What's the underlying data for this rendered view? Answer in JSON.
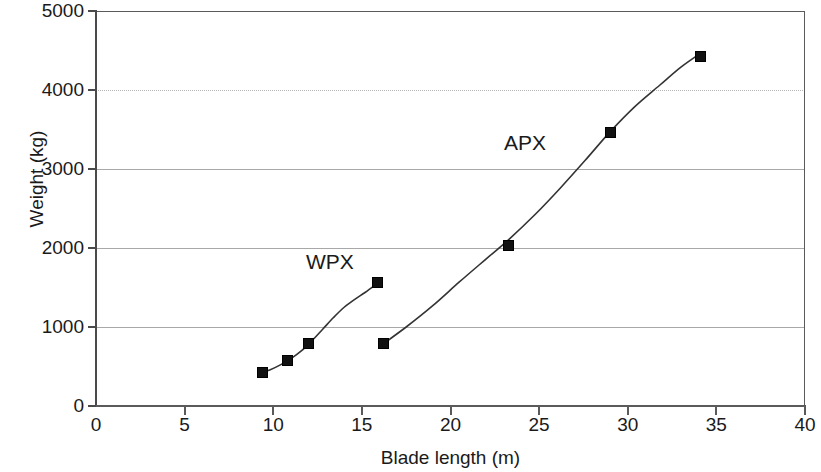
{
  "chart_data": {
    "type": "scatter",
    "title": "",
    "xlabel": "Blade length (m)",
    "ylabel": "Weight (kg)",
    "xlim": [
      0,
      40
    ],
    "ylim": [
      0,
      5000
    ],
    "xticks": [
      0,
      5,
      10,
      15,
      20,
      25,
      30,
      35,
      40
    ],
    "yticks": [
      0,
      1000,
      2000,
      3000,
      4000,
      5000
    ],
    "xtick_labels": [
      "0",
      "5",
      "10",
      "15",
      "20",
      "25",
      "30",
      "35",
      "40"
    ],
    "ytick_labels": [
      "0",
      "1000",
      "2000",
      "3000",
      "4000",
      "5000"
    ],
    "grid": "horizontal",
    "legend": "inline-annotations",
    "marker_color": "#111111",
    "line_color": "#333333",
    "gridline_color": "#a8a8a8",
    "axis_color": "#4a4a4a",
    "series": [
      {
        "name": "WPX",
        "label_x": 13.2,
        "label_y": 1820,
        "points": [
          {
            "x": 9.4,
            "y": 430
          },
          {
            "x": 10.8,
            "y": 580
          },
          {
            "x": 12.0,
            "y": 790
          },
          {
            "x": 15.9,
            "y": 1560
          }
        ],
        "fit_curve": [
          {
            "x": 9.2,
            "y": 410
          },
          {
            "x": 9.8,
            "y": 455
          },
          {
            "x": 10.4,
            "y": 520
          },
          {
            "x": 11.0,
            "y": 600
          },
          {
            "x": 11.6,
            "y": 700
          },
          {
            "x": 12.2,
            "y": 830
          },
          {
            "x": 12.8,
            "y": 975
          },
          {
            "x": 13.4,
            "y": 1120
          },
          {
            "x": 14.0,
            "y": 1250
          },
          {
            "x": 14.6,
            "y": 1350
          },
          {
            "x": 15.2,
            "y": 1440
          },
          {
            "x": 15.9,
            "y": 1555
          }
        ]
      },
      {
        "name": "APX",
        "label_x": 24.2,
        "label_y": 3330,
        "points": [
          {
            "x": 16.2,
            "y": 790
          },
          {
            "x": 23.3,
            "y": 2030
          },
          {
            "x": 29.0,
            "y": 3460
          },
          {
            "x": 34.1,
            "y": 4430
          }
        ],
        "fit_curve": [
          {
            "x": 16.1,
            "y": 770
          },
          {
            "x": 17.5,
            "y": 1000
          },
          {
            "x": 19.0,
            "y": 1270
          },
          {
            "x": 20.5,
            "y": 1570
          },
          {
            "x": 22.0,
            "y": 1860
          },
          {
            "x": 23.3,
            "y": 2110
          },
          {
            "x": 24.8,
            "y": 2430
          },
          {
            "x": 26.2,
            "y": 2760
          },
          {
            "x": 27.6,
            "y": 3110
          },
          {
            "x": 29.0,
            "y": 3470
          },
          {
            "x": 30.4,
            "y": 3790
          },
          {
            "x": 31.8,
            "y": 4060
          },
          {
            "x": 33.0,
            "y": 4290
          },
          {
            "x": 34.2,
            "y": 4480
          }
        ]
      }
    ]
  }
}
